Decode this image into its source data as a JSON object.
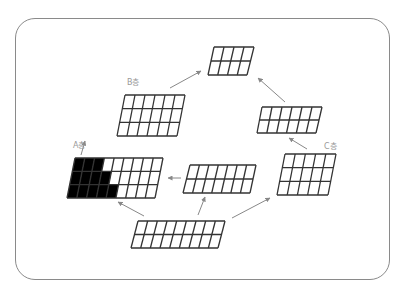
{
  "diagram": {
    "labels": {
      "a": "A층",
      "b": "B층",
      "c": "C층"
    },
    "colors": {
      "frame": "#8a8a8a",
      "grid_line": "#333333",
      "filled": "#000000",
      "arrow": "#888888",
      "label": "#999999"
    },
    "grids": [
      {
        "id": "top",
        "cols": 4,
        "rows": 2,
        "tl": [
          214,
          47
        ],
        "tr": [
          254,
          47
        ],
        "bl": [
          208,
          75
        ],
        "br": [
          247,
          75
        ],
        "filled": []
      },
      {
        "id": "b",
        "label": "B층",
        "cols": 6,
        "rows": 3,
        "tl": [
          125,
          95
        ],
        "tr": [
          185,
          95
        ],
        "bl": [
          117,
          136
        ],
        "br": [
          177,
          136
        ],
        "filled": []
      },
      {
        "id": "right",
        "cols": 6,
        "rows": 2,
        "tl": [
          262,
          107
        ],
        "tr": [
          322,
          107
        ],
        "bl": [
          257,
          133
        ],
        "br": [
          316,
          133
        ],
        "filled": []
      },
      {
        "id": "a",
        "label": "A층",
        "cols": 9,
        "rows": 3,
        "tl": [
          75,
          158
        ],
        "tr": [
          163,
          158
        ],
        "bl": [
          67,
          198
        ],
        "br": [
          155,
          198
        ],
        "filled": [
          3,
          4,
          5
        ]
      },
      {
        "id": "middle",
        "cols": 7,
        "rows": 2,
        "tl": [
          190,
          165
        ],
        "tr": [
          256,
          165
        ],
        "bl": [
          183,
          193
        ],
        "br": [
          250,
          193
        ],
        "filled": []
      },
      {
        "id": "c",
        "label": "C층",
        "cols": 5,
        "rows": 3,
        "tl": [
          285,
          154
        ],
        "tr": [
          336,
          154
        ],
        "bl": [
          277,
          195
        ],
        "br": [
          328,
          195
        ],
        "filled": []
      },
      {
        "id": "bottom",
        "cols": 9,
        "rows": 2,
        "tl": [
          138,
          221
        ],
        "tr": [
          225,
          221
        ],
        "bl": [
          131,
          248
        ],
        "br": [
          218,
          248
        ],
        "filled": []
      }
    ],
    "arrows": [
      {
        "from": [
          170,
          88
        ],
        "to": [
          201,
          71
        ]
      },
      {
        "from": [
          285,
          102
        ],
        "to": [
          258,
          78
        ]
      },
      {
        "from": [
          307,
          149
        ],
        "to": [
          289,
          138
        ]
      },
      {
        "from": [
          181,
          178
        ],
        "to": [
          168,
          178
        ]
      },
      {
        "from": [
          144,
          216
        ],
        "to": [
          118,
          202
        ]
      },
      {
        "from": [
          198,
          215
        ],
        "to": [
          205,
          197
        ]
      },
      {
        "from": [
          232,
          218
        ],
        "to": [
          270,
          198
        ]
      },
      {
        "from": [
          81,
          155
        ],
        "to": [
          85,
          141
        ]
      }
    ]
  }
}
